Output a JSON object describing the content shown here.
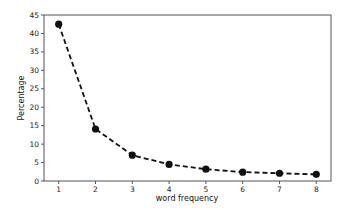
{
  "chart_data": {
    "type": "line",
    "title": "",
    "xlabel": "word frequency",
    "ylabel": "Percentage",
    "x": [
      1,
      2,
      3,
      4,
      5,
      6,
      7,
      8
    ],
    "series": [
      {
        "name": "Percentage",
        "values": [
          42.5,
          14.1,
          7.0,
          4.5,
          3.2,
          2.4,
          2.1,
          1.8
        ],
        "line_style": "dashed",
        "marker": "circle",
        "color": "#111111"
      }
    ],
    "xticks": [
      "1",
      "2",
      "3",
      "4",
      "5",
      "6",
      "7",
      "8"
    ],
    "yticks": [
      "0",
      "5",
      "10",
      "15",
      "20",
      "25",
      "30",
      "35",
      "40",
      "45"
    ],
    "xlim": [
      0.6,
      8.4
    ],
    "ylim": [
      0,
      45
    ],
    "grid": false,
    "legend": null
  }
}
